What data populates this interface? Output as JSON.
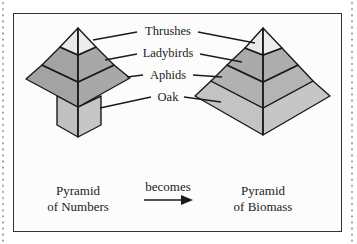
{
  "diagram": {
    "levels": [
      {
        "name": "Thrushes",
        "color_left": "#e9e9e9",
        "color_right": "#e9e9e9"
      },
      {
        "name": "Ladybirds",
        "color_left": "#a3a3a3",
        "color_right": "#aaaaaa"
      },
      {
        "name": "Aphids",
        "color_left": "#a3a3a3",
        "color_right": "#b1b1b1"
      },
      {
        "name": "Oak",
        "color_left": "#c0c0c0",
        "color_right": "#c3c3c3"
      }
    ],
    "labels": {
      "thrushes": "Thrushes",
      "ladybirds": "Ladybirds",
      "aphids": "Aphids",
      "oak": "Oak"
    },
    "left_caption": {
      "line1": "Pyramid",
      "line2": "of Numbers"
    },
    "connector": {
      "label": "becomes",
      "icon": "arrow-right-icon"
    },
    "right_caption": {
      "line1": "Pyramid",
      "line2": "of Biomass"
    }
  }
}
